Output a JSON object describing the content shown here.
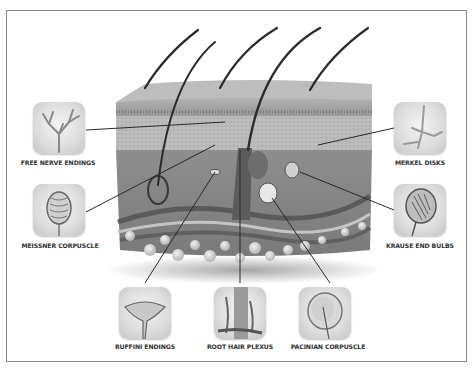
{
  "diagram": {
    "labels": {
      "free_nerve_endings": "FREE NERVE ENDINGS",
      "meissner_corpuscle": "MEISSNER CORPUSCLE",
      "merkel_disks": "MERKEL DISKS",
      "krause_end_bulbs": "KRAUSE END BULBS",
      "ruffini_endings": "RUFFINI ENDINGS",
      "root_hair_plexus": "ROOT HAIR PLEXUS",
      "pacinian_corpuscle": "PACINIAN CORPUSCLE"
    },
    "colors": {
      "frame": "#8a8a8a",
      "skin": "#8c8c8c",
      "leader_line": "#2a2a2a",
      "label_text": "#333333"
    }
  }
}
